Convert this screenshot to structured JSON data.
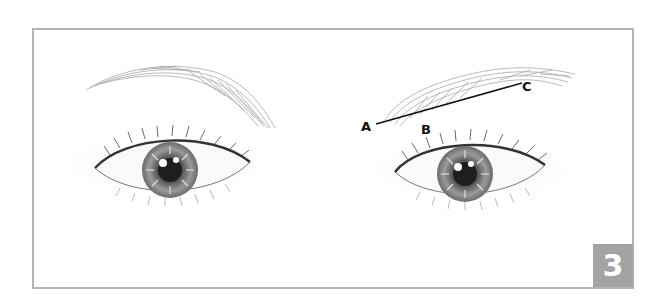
{
  "figure": {
    "step_number": "3",
    "step_box_color": "#a3a3a3",
    "frame_color": "#b4b4b4",
    "labels": [
      {
        "id": "A",
        "text": "A",
        "x": 361,
        "y": 120
      },
      {
        "id": "B",
        "text": "B",
        "x": 421,
        "y": 123
      },
      {
        "id": "C",
        "text": "C",
        "x": 522,
        "y": 80
      }
    ],
    "guide_line": {
      "from": "A",
      "to": "C",
      "x1": 376,
      "y1": 124,
      "x2": 522,
      "y2": 83
    },
    "elements": [
      "left-eyebrow",
      "left-eye",
      "right-eyebrow",
      "right-eye"
    ]
  }
}
